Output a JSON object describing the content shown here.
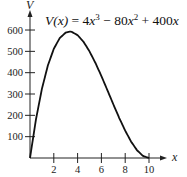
{
  "chart_data": {
    "type": "line",
    "equation": {
      "lhs": "V(x)",
      "rhs_parts": [
        "4",
        "x",
        "3",
        " − 80",
        "x",
        "2",
        " + 400",
        "x"
      ]
    },
    "xlabel": "x",
    "ylabel": "V",
    "xlim": [
      0,
      10
    ],
    "ylim": [
      0,
      600
    ],
    "x_ticks": [
      2,
      4,
      6,
      8,
      10
    ],
    "y_ticks": [
      100,
      200,
      300,
      400,
      500,
      600
    ],
    "grid": false,
    "legend": null,
    "series": [
      {
        "name": "V(x)",
        "x": [
          0,
          0.5,
          1,
          1.5,
          2,
          2.5,
          3,
          3.333,
          3.5,
          4,
          4.5,
          5,
          5.5,
          6,
          6.5,
          7,
          7.5,
          8,
          8.5,
          9,
          9.5,
          10
        ],
        "values": [
          0,
          180.5,
          324,
          433.5,
          512,
          562.5,
          588,
          592.6,
          591.5,
          576,
          544.5,
          500,
          445.5,
          384,
          318.5,
          252,
          187.5,
          128,
          76.5,
          36,
          9.5,
          0
        ]
      }
    ],
    "annotations": [
      "V(x) = 4x^3 - 80x^2 + 400x"
    ]
  }
}
